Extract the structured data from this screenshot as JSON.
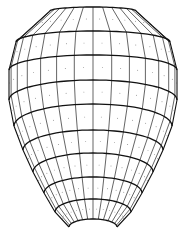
{
  "diagram": {
    "colors": {
      "background": "#ffffff",
      "line": "#111111",
      "dot": "#555555"
    },
    "rings": [
      {
        "y_center": 7,
        "y_edge": 11,
        "half_width": 43
      },
      {
        "y_center": 31,
        "y_edge": 42,
        "half_width": 77
      },
      {
        "y_center": 55,
        "y_edge": 70,
        "half_width": 84
      },
      {
        "y_center": 80,
        "y_edge": 100,
        "half_width": 84
      },
      {
        "y_center": 104,
        "y_edge": 126,
        "half_width": 79
      },
      {
        "y_center": 130,
        "y_edge": 150,
        "half_width": 70
      },
      {
        "y_center": 153,
        "y_edge": 172,
        "half_width": 60
      },
      {
        "y_center": 177,
        "y_edge": 193,
        "half_width": 49
      },
      {
        "y_center": 199,
        "y_edge": 212,
        "half_width": 38
      },
      {
        "y_center": 219,
        "y_edge": 227,
        "half_width": 24
      }
    ],
    "center_x": 93,
    "meridian_count": 14
  }
}
